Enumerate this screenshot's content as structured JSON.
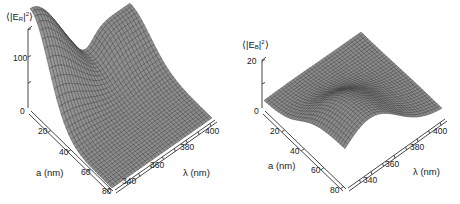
{
  "figure": {
    "panels": [
      {
        "id": "left",
        "zlabel": {
          "pre": "⟨|E",
          "sub": "R",
          "mid": "|",
          "sup": "2",
          "post": "⟩"
        },
        "z_ticks": [
          "0",
          "100"
        ],
        "a_ticks": [
          "20",
          "40",
          "60",
          "80"
        ],
        "lambda_ticks": [
          "340",
          "360",
          "380",
          "400"
        ],
        "a_label": "a (nm)",
        "lambda_label": "λ (nm)"
      },
      {
        "id": "right",
        "zlabel": {
          "pre": "⟨|E",
          "sub": "B",
          "mid": "|",
          "sup": "2",
          "post": "⟩"
        },
        "z_ticks": [
          "0",
          "20"
        ],
        "a_ticks": [
          "20",
          "40",
          "60",
          "80"
        ],
        "lambda_ticks": [
          "340",
          "360",
          "380",
          "400"
        ],
        "a_label": "a (nm)",
        "lambda_label": "λ (nm)"
      }
    ]
  },
  "chart_data": [
    {
      "type": "surface",
      "title": "",
      "xlabel": "a (nm)",
      "ylabel": "λ (nm)",
      "zlabel": "⟨|E_R|²⟩",
      "x_ticks": [
        20,
        40,
        60,
        80
      ],
      "y_ticks": [
        340,
        360,
        380,
        400
      ],
      "z_ticks": [
        0,
        100
      ],
      "x_range": [
        0,
        80
      ],
      "y_range": [
        330,
        410
      ],
      "z_range": [
        0,
        140
      ],
      "description": "Peak ~140 at small a, short λ; decays toward large a; dip/valley at intermediate λ near a≈0; near-zero plateau at large a",
      "peak": {
        "a": 2,
        "lambda": 335,
        "value": 140
      }
    },
    {
      "type": "surface",
      "title": "",
      "xlabel": "a (nm)",
      "ylabel": "λ (nm)",
      "zlabel": "⟨|E_B|²⟩",
      "x_ticks": [
        20,
        40,
        60,
        80
      ],
      "y_ticks": [
        340,
        360,
        380,
        400
      ],
      "z_ticks": [
        0,
        20
      ],
      "x_range": [
        0,
        80
      ],
      "y_range": [
        330,
        410
      ],
      "z_range": [
        0,
        25
      ],
      "description": "Rises toward large a; broad maximum ~20 at large a, short-to-mid λ; small at small a",
      "peak": {
        "a": 80,
        "lambda": 340,
        "value": 20
      }
    }
  ]
}
